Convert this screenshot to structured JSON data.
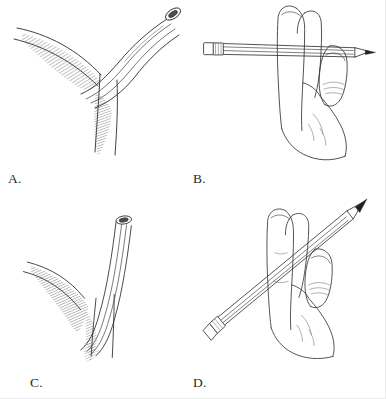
{
  "figure": {
    "kind": "line-art-illustration-plate",
    "layout": "2x2",
    "background_color": "#ffffff",
    "ink_color": "#2d2d2d",
    "panel_count": 4
  },
  "panels": [
    {
      "id": "a",
      "label": "A.",
      "subject": "cannula-in-vessel-shallow-angle",
      "elements": [
        "tube-open-lumen-ellipse",
        "tube-body-curved",
        "vessel-wall-upper",
        "vessel-wall-lower",
        "cross-hatch-shading"
      ]
    },
    {
      "id": "b",
      "label": "B.",
      "subject": "hand-holding-pencil-horizontal",
      "elements": [
        "index-finger",
        "middle-finger",
        "thumb",
        "palm-outline",
        "pencil-horizontal",
        "pencil-eraser-ferrule",
        "pencil-tip-lead"
      ]
    },
    {
      "id": "c",
      "label": "C.",
      "subject": "cannula-in-vessel-steep-angle",
      "elements": [
        "tube-open-lumen-ellipse",
        "tube-body-straight",
        "vessel-wall-upper",
        "vessel-wall-lower",
        "cross-hatch-shading"
      ]
    },
    {
      "id": "d",
      "label": "D.",
      "subject": "hand-holding-pencil-angled",
      "elements": [
        "index-finger",
        "middle-finger",
        "thumb",
        "palm-outline",
        "pencil-diagonal",
        "pencil-eraser-ferrule",
        "pencil-tip-lead"
      ]
    }
  ]
}
